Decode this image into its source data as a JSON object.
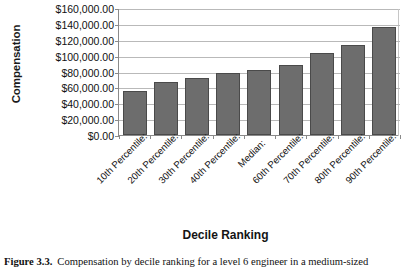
{
  "figure": {
    "caption_label": "Figure 3.3.",
    "caption_text": "Compensation by decile ranking for a level 6 engineer in a medium-sized"
  },
  "axes": {
    "ylabel": "Compensation",
    "xlabel": "Decile Ranking",
    "ytick_labels": [
      "$160,000.00",
      "$140,000.00",
      "$120,000.00",
      "$100,000.00",
      "$80,000.00",
      "$60,000.00",
      "$40,000.00",
      "$20,000.00",
      "$0.00"
    ]
  },
  "colors": {
    "bar_fill": "#6d6d6d",
    "bar_border": "#4a4a4a",
    "gridline": "#b9b9b9",
    "axis": "#8a8a8a",
    "text": "#111111",
    "background": "#ffffff"
  },
  "chart_data": {
    "type": "bar",
    "title": "",
    "xlabel": "Decile Ranking",
    "ylabel": "Compensation",
    "ylim": [
      0,
      160000
    ],
    "ytick_step": 20000,
    "grid": true,
    "legend": "none",
    "categories": [
      "10th Percentile:",
      "20th Percentile:",
      "30th Percentile:",
      "40th Percentile:",
      "Median:",
      "60th Percentile:",
      "70th Percentile:",
      "80th Percentile:",
      "90th Percentile:"
    ],
    "values": [
      55000,
      67000,
      72000,
      78000,
      82000,
      88000,
      103000,
      113000,
      136000
    ]
  }
}
